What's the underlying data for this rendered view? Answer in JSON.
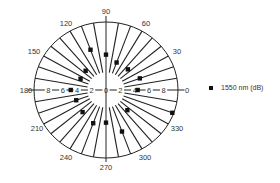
{
  "chart_data": {
    "type": "polar-scatter",
    "title": "",
    "angle_unit": "degrees",
    "angle_ticks": [
      0,
      30,
      60,
      90,
      120,
      150,
      180,
      210,
      240,
      270,
      300,
      330
    ],
    "radial_ticks": [
      0,
      2,
      4,
      6,
      8
    ],
    "radial_range": [
      0,
      10
    ],
    "spoke_interval_deg": 10,
    "grid": true,
    "legend_position": "right",
    "series": [
      {
        "name": "1550 nm (dB)",
        "marker": "square",
        "color": "#111111",
        "points": [
          {
            "angle": 0,
            "value": 4.4
          },
          {
            "angle": 20,
            "value": 5.0
          },
          {
            "angle": 45,
            "value": 4.3
          },
          {
            "angle": 70,
            "value": 4.3
          },
          {
            "angle": 90,
            "value": 5.2
          },
          {
            "angle": 110,
            "value": 6.3
          },
          {
            "angle": 135,
            "value": 4.0
          },
          {
            "angle": 155,
            "value": 3.9
          },
          {
            "angle": 180,
            "value": 4.9
          },
          {
            "angle": 200,
            "value": 4.4
          },
          {
            "angle": 225,
            "value": 4.6
          },
          {
            "angle": 250,
            "value": 5.2
          },
          {
            "angle": 270,
            "value": 4.8
          },
          {
            "angle": 290,
            "value": 6.5
          },
          {
            "angle": 315,
            "value": 4.2
          },
          {
            "angle": 340,
            "value": 9.8
          }
        ]
      }
    ]
  },
  "legend": {
    "items": [
      {
        "label": "1550 nm (dB)",
        "marker": "square",
        "color": "#111111"
      }
    ]
  },
  "colors": {
    "axis": "#222222",
    "background": "#ffffff"
  }
}
